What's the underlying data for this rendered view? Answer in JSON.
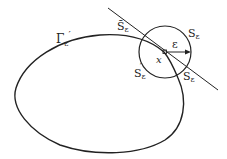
{
  "diagram": {
    "labels": {
      "curve": "Γ",
      "curve_sub": "ε",
      "curve_prime": "′",
      "s_bar": "S̄",
      "s_bar_sub": "ε",
      "s_right": "S",
      "s_right_sub": "ε",
      "s_prime": "S",
      "s_prime_sub": "ε",
      "s_prime_mark": "′",
      "s_lower": "S",
      "s_lower_sub": "ε",
      "point": "x",
      "radius": "ε"
    },
    "colors": {
      "stroke": "#222222",
      "background": "#ffffff"
    }
  }
}
